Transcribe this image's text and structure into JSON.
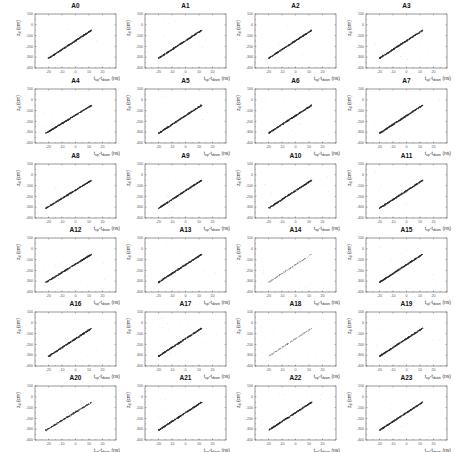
{
  "chart_data": {
    "type": "scatter",
    "layout": {
      "rows": 6,
      "cols": 4,
      "grid": false,
      "legend": "none"
    },
    "shared_axes": {
      "xlabel": "t_up-t_down (ns)",
      "xlabel_parts": {
        "main": "t",
        "sub1": "up",
        "dash": "-t",
        "sub2": "down",
        "unit": " (ns)"
      },
      "ylabel": "z_d (cm)",
      "ylabel_parts": {
        "main": "z",
        "sub": "d",
        "unit": " (cm)"
      },
      "xlim": [
        -30,
        30
      ],
      "ylim": [
        -400,
        100
      ],
      "xticks": [
        -20,
        -10,
        0,
        10,
        20
      ],
      "yticks": [
        100,
        0,
        -100,
        -200,
        -300,
        -400
      ]
    },
    "panels": [
      {
        "title": "A0",
        "density": "high",
        "line": {
          "x": [
            -20,
            12
          ],
          "y": [
            -310,
            -50
          ]
        }
      },
      {
        "title": "A1",
        "density": "high",
        "line": {
          "x": [
            -20,
            12
          ],
          "y": [
            -310,
            -50
          ]
        }
      },
      {
        "title": "A2",
        "density": "high",
        "line": {
          "x": [
            -20,
            12
          ],
          "y": [
            -310,
            -50
          ]
        }
      },
      {
        "title": "A3",
        "density": "high",
        "line": {
          "x": [
            -20,
            12
          ],
          "y": [
            -310,
            -50
          ]
        }
      },
      {
        "title": "A4",
        "density": "high",
        "line": {
          "x": [
            -22,
            12
          ],
          "y": [
            -310,
            -50
          ]
        }
      },
      {
        "title": "A5",
        "density": "high",
        "line": {
          "x": [
            -20,
            12
          ],
          "y": [
            -310,
            -50
          ]
        }
      },
      {
        "title": "A6",
        "density": "high",
        "line": {
          "x": [
            -20,
            12
          ],
          "y": [
            -310,
            -50
          ]
        }
      },
      {
        "title": "A7",
        "density": "high",
        "line": {
          "x": [
            -20,
            12
          ],
          "y": [
            -310,
            -50
          ]
        }
      },
      {
        "title": "A8",
        "density": "high",
        "line": {
          "x": [
            -22,
            12
          ],
          "y": [
            -310,
            -50
          ]
        }
      },
      {
        "title": "A9",
        "density": "high",
        "line": {
          "x": [
            -20,
            12
          ],
          "y": [
            -310,
            -50
          ]
        }
      },
      {
        "title": "A10",
        "density": "high",
        "line": {
          "x": [
            -20,
            12
          ],
          "y": [
            -310,
            -50
          ]
        }
      },
      {
        "title": "A11",
        "density": "high",
        "line": {
          "x": [
            -20,
            12
          ],
          "y": [
            -310,
            -50
          ]
        }
      },
      {
        "title": "A12",
        "density": "high",
        "line": {
          "x": [
            -22,
            12
          ],
          "y": [
            -310,
            -50
          ]
        }
      },
      {
        "title": "A13",
        "density": "high",
        "line": {
          "x": [
            -20,
            12
          ],
          "y": [
            -310,
            -50
          ]
        }
      },
      {
        "title": "A14",
        "density": "low",
        "line": {
          "x": [
            -20,
            12
          ],
          "y": [
            -310,
            -50
          ]
        }
      },
      {
        "title": "A15",
        "density": "high",
        "line": {
          "x": [
            -20,
            12
          ],
          "y": [
            -310,
            -50
          ]
        }
      },
      {
        "title": "A16",
        "density": "high",
        "line": {
          "x": [
            -20,
            12
          ],
          "y": [
            -310,
            -50
          ]
        }
      },
      {
        "title": "A17",
        "density": "high",
        "line": {
          "x": [
            -20,
            12
          ],
          "y": [
            -310,
            -50
          ]
        }
      },
      {
        "title": "A18",
        "density": "low",
        "line": {
          "x": [
            -20,
            12
          ],
          "y": [
            -310,
            -50
          ]
        }
      },
      {
        "title": "A19",
        "density": "high",
        "line": {
          "x": [
            -20,
            12
          ],
          "y": [
            -310,
            -50
          ]
        }
      },
      {
        "title": "A20",
        "density": "medium",
        "line": {
          "x": [
            -22,
            12
          ],
          "y": [
            -310,
            -50
          ]
        }
      },
      {
        "title": "A21",
        "density": "high",
        "line": {
          "x": [
            -20,
            12
          ],
          "y": [
            -310,
            -50
          ]
        }
      },
      {
        "title": "A22",
        "density": "high",
        "line": {
          "x": [
            -20,
            12
          ],
          "y": [
            -310,
            -50
          ]
        }
      },
      {
        "title": "A23",
        "density": "high",
        "line": {
          "x": [
            -20,
            12
          ],
          "y": [
            -310,
            -50
          ]
        }
      }
    ]
  },
  "colors": {
    "points": "#2a2a2a",
    "points_light": "#6a6a6a",
    "outliers": "#b0b0b0",
    "frame": "#555555",
    "text": "#222222"
  }
}
